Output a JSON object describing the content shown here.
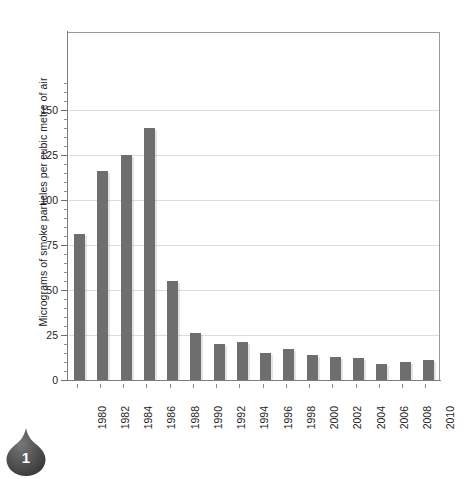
{
  "figure": {
    "badge_number": "1",
    "badge_icon": "map-pin-marker-icon",
    "background_color": "#ffffff"
  },
  "chart_data": {
    "type": "bar",
    "title": "",
    "subtitle": "",
    "xlabel": "",
    "ylabel": "Micrograms of smoke particles per cubic metre of air",
    "categories": [
      "1980",
      "1982",
      "1984",
      "1986",
      "1988",
      "1990",
      "1992",
      "1994",
      "1996",
      "1998",
      "2000",
      "2002",
      "2004",
      "2006",
      "2008",
      "2010"
    ],
    "values": [
      81,
      116,
      125,
      140,
      55,
      26,
      20,
      21,
      15,
      17,
      14,
      13,
      12,
      9,
      10,
      11
    ],
    "ylim": [
      0,
      165
    ],
    "ytick_labels": [
      "0",
      "25",
      "50",
      "75",
      "100",
      "125",
      "150"
    ],
    "ytick_values": [
      0,
      25,
      50,
      75,
      100,
      125,
      150
    ],
    "yminor_step": 5,
    "grid": "horizontal",
    "legend": "none",
    "bar_color": "#6e6e6e",
    "grid_color": "#dcdcdc",
    "axis_color": "#7d7d7d"
  }
}
